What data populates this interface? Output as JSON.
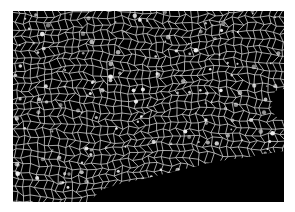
{
  "image": {
    "subject": "white lace net mesh draped on black background",
    "background_color": "#000000",
    "mesh_color": "#d8d8d8",
    "border_color": "#ffffff"
  }
}
